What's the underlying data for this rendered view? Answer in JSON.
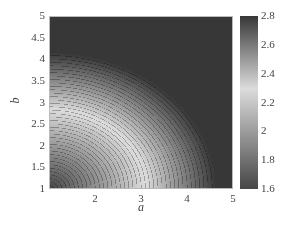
{
  "chart_data": {
    "type": "heatmap",
    "subtype": "filled-contour",
    "title": "",
    "xlabel": "a",
    "ylabel": "b",
    "xlim": [
      1,
      5
    ],
    "ylim": [
      1,
      5
    ],
    "xticks": [
      "2",
      "3",
      "4",
      "5"
    ],
    "yticks": [
      "1",
      "1.5",
      "2",
      "2.5",
      "3",
      "3.5",
      "4",
      "4.5",
      "5"
    ],
    "colorbar": {
      "range": [
        1.6,
        2.8
      ],
      "ticks": [
        "1.6",
        "1.8",
        "2",
        "2.2",
        "2.4",
        "2.6",
        "2.8"
      ],
      "colormap": "grayscale diverging: dark at 1.6, light near 2.3, dark at 2.8"
    },
    "field_description": "Value increases monotonically outward from a minimum (~1.6) near (a=1,b=1); lightest band (~2.3) passes approx (1,2.8)-(2.5,2.3)-(2.9,1); corners (1,5) and (5,5) ~2.8, (5,1) ~2.7",
    "field_model": {
      "center": [
        1.0,
        1.0
      ],
      "scale_a": 1.15,
      "scale_b": 1.0,
      "min": 1.6,
      "max": 2.8,
      "rate": 0.38,
      "contour_levels": 40
    },
    "sample_values": [
      {
        "a": 1,
        "b": 1,
        "value": 1.6
      },
      {
        "a": 3,
        "b": 1,
        "value": 2.3
      },
      {
        "a": 1,
        "b": 3,
        "value": 2.35
      },
      {
        "a": 1,
        "b": 5,
        "value": 2.8
      },
      {
        "a": 5,
        "b": 1,
        "value": 2.7
      },
      {
        "a": 5,
        "b": 5,
        "value": 2.8
      }
    ],
    "grid": false,
    "legend": "colorbar right"
  },
  "labels": {
    "x": "a",
    "y": "b"
  }
}
